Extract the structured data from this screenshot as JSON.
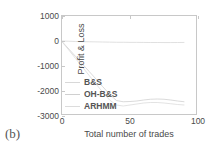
{
  "panel_label": "(b)",
  "legend": {
    "entries": [
      {
        "label": "B&S",
        "color": "#d8d8d8"
      },
      {
        "label": "OH-B&S",
        "color": "#d0d0d0"
      },
      {
        "label": "ARHMM",
        "color": "#dcdcdc"
      }
    ]
  },
  "chart_data": {
    "type": "line",
    "title": "",
    "xlabel": "Total number of trades",
    "ylabel": "Profit & Loss",
    "xlim": [
      0,
      100
    ],
    "ylim": [
      -3000,
      1000
    ],
    "xticks": [
      0,
      50,
      100
    ],
    "yticks": [
      1000,
      0,
      -1000,
      -2000,
      -3000
    ],
    "xtick_labels": [
      "0",
      "50",
      "100"
    ],
    "ytick_labels": [
      "1000",
      "0",
      "-1000",
      "-2000",
      "-3000"
    ],
    "grid": false,
    "legend_position": "lower-left-inside",
    "series": [
      {
        "name": "B&S",
        "color": "#d8d8d8",
        "x": [
          0,
          5,
          10,
          15,
          20,
          25,
          30,
          35,
          40,
          45,
          50,
          55,
          60,
          65,
          70,
          75,
          80,
          85,
          90
        ],
        "values": [
          0,
          -10,
          -20,
          -25,
          -30,
          -35,
          -40,
          -45,
          -50,
          -50,
          -55,
          -55,
          -58,
          -60,
          -60,
          -62,
          -62,
          -60,
          -58
        ]
      },
      {
        "name": "OH-B&S",
        "color": "#d0d0d0",
        "x": [
          0,
          5,
          10,
          15,
          20,
          25,
          30,
          35,
          40,
          45,
          50,
          55,
          60,
          65,
          70,
          75,
          80,
          85,
          90
        ],
        "values": [
          -20,
          -320,
          -620,
          -920,
          -1220,
          -1520,
          -1830,
          -2130,
          -2380,
          -2430,
          -2420,
          -2400,
          -2360,
          -2330,
          -2320,
          -2330,
          -2360,
          -2400,
          -2430
        ]
      },
      {
        "name": "ARHMM",
        "color": "#dcdcdc",
        "x": [
          0,
          5,
          10,
          15,
          20,
          25,
          30,
          35,
          40,
          45,
          50,
          55,
          60,
          65,
          70,
          75,
          80,
          85,
          90
        ],
        "values": [
          -30,
          -360,
          -700,
          -1040,
          -1380,
          -1720,
          -2050,
          -2360,
          -2560,
          -2600,
          -2560,
          -2520,
          -2480,
          -2460,
          -2460,
          -2480,
          -2510,
          -2540,
          -2560
        ]
      }
    ]
  }
}
